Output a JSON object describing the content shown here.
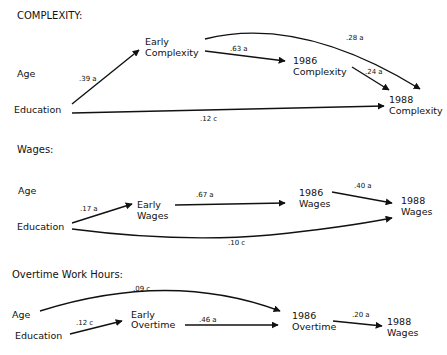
{
  "panels": [
    {
      "title": "COMPLEXITY:",
      "nodes": {
        "age": "Age",
        "education": "Education",
        "early_1": "Early",
        "early_2": "Complexity",
        "y86_1": "1986",
        "y86_2": "Complexity",
        "y88_1": "1988",
        "y88_2": "Complexity"
      },
      "paths": {
        "edu_early": ".39 a",
        "early_86": ".63 a",
        "early_88": ".28 a",
        "y86_88": ".24 a",
        "edu_88": ".12 c"
      }
    },
    {
      "title": "Wages:",
      "nodes": {
        "age": "Age",
        "education": "Education",
        "early_1": "Early",
        "early_2": "Wages",
        "y86_1": "1986",
        "y86_2": "Wages",
        "y88_1": "1988",
        "y88_2": "Wages"
      },
      "paths": {
        "edu_early": ".17 a",
        "early_86": ".67 a",
        "y86_88": ".40 a",
        "edu_88": ".10 c"
      }
    },
    {
      "title": "Overtime Work Hours:",
      "nodes": {
        "age": "Age",
        "education": "Education",
        "early_1": "Early",
        "early_2": "Overtime",
        "y86_1": "1986",
        "y86_2": "Overtime",
        "y88_1": "1988",
        "y88_2": "Wages"
      },
      "paths": {
        "age_86": ".09 c",
        "edu_early": ".12 c",
        "early_86": ".46 a",
        "y86_88": ".20 a"
      }
    }
  ]
}
